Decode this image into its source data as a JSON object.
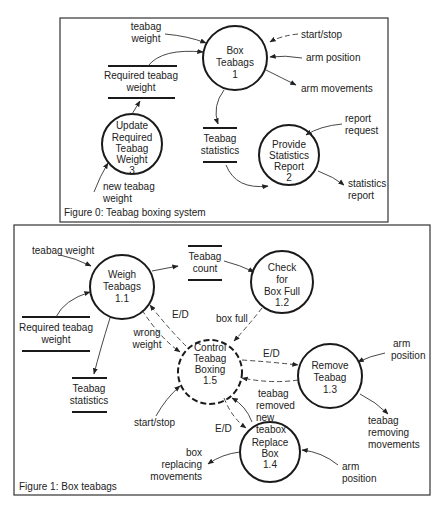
{
  "figure0": {
    "caption": "Figure 0: Teabag boxing system",
    "processes": {
      "p1": {
        "l1": "Box",
        "l2": "Teabags",
        "l3": "1"
      },
      "p2": {
        "l1": "Provide",
        "l2": "Statistics",
        "l3": "Report",
        "l4": "2"
      },
      "p3": {
        "l1": "Update",
        "l2": "Required",
        "l3": "Teabag",
        "l4": "Weight",
        "l5": "3"
      }
    },
    "stores": {
      "req_weight": {
        "l1": "Required teabag",
        "l2": "weight"
      },
      "statistics": {
        "l1": "Teabag",
        "l2": "statistics"
      }
    },
    "flows": {
      "teabag_weight": {
        "l1": "teabag",
        "l2": "weight"
      },
      "start_stop": "start/stop",
      "arm_position": "arm position",
      "arm_movements": "arm movements",
      "report_request": {
        "l1": "report",
        "l2": "request"
      },
      "statistics_report": {
        "l1": "statistics",
        "l2": "report"
      },
      "new_teabag_weight": {
        "l1": "new teabag",
        "l2": "weight"
      }
    }
  },
  "figure1": {
    "caption": "Figure 1:  Box teabags",
    "processes": {
      "p11": {
        "l1": "Weigh",
        "l2": "Teabags",
        "l3": "1.1"
      },
      "p12": {
        "l1": "Check",
        "l2": "for",
        "l3": "Box Full",
        "l4": "1.2"
      },
      "p13": {
        "l1": "Remove",
        "l2": "Teabag",
        "l3": "1.3"
      },
      "p14": {
        "l1": "Replace",
        "l2": "Box",
        "l3": "1.4"
      },
      "p15": {
        "l1": "Control",
        "l2": "Teabag",
        "l3": "Boxing",
        "l4": "1.5"
      }
    },
    "stores": {
      "count": {
        "l1": "Teabag",
        "l2": "count"
      },
      "req_weight": {
        "l1": "Required teabag",
        "l2": "weight"
      },
      "statistics": {
        "l1": "Teabag",
        "l2": "statistics"
      }
    },
    "flows": {
      "teabag_weight": "teabag weight",
      "ed_11": "E/D",
      "wrong_weight": {
        "l1": "wrong",
        "l2": "weight"
      },
      "box_full": "box full",
      "ed_13": "E/D",
      "teabag_removed": {
        "l1": "teabag",
        "l2": "removed",
        "l3": "new",
        "l4": "teabox"
      },
      "ed_14": "E/D",
      "start_stop": "start/stop",
      "arm_position_13": {
        "l1": "arm",
        "l2": "position"
      },
      "removing_movements": {
        "l1": "teabag",
        "l2": "removing",
        "l3": "movements"
      },
      "replacing_movements": {
        "l1": "box",
        "l2": "replacing",
        "l3": "movements"
      },
      "arm_position_14": {
        "l1": "arm",
        "l2": "position"
      }
    }
  }
}
